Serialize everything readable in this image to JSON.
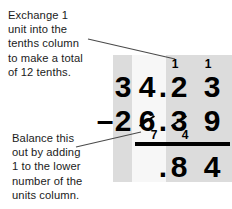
{
  "notes": {
    "top": "Exchange 1\nunit into the\ntenths column\nto make a total\nof 12 tenths.",
    "bottom": "Balance this\nout by adding\n1 to the lower\nnumber of the\nunits column."
  },
  "columns": [
    {
      "name": "tens",
      "shade": "#dcdcdc"
    },
    {
      "name": "units",
      "shade": "#f7f7f7"
    },
    {
      "name": "tenths",
      "shade": "#dcdcdc"
    },
    {
      "name": "hundredths",
      "shade": "#dcdcdc"
    }
  ],
  "calculation": {
    "operator": "–",
    "minuend": "34.23",
    "subtrahend": "26.39",
    "difference": ".84",
    "rows": {
      "top": {
        "tens": "3",
        "units": "4",
        "point": ".",
        "tenths": "2",
        "hundredths": "3",
        "carry_tenths": "1",
        "carry_hundredths": "1"
      },
      "bottom": {
        "operator": "–",
        "tens": "2",
        "units": "6",
        "units_struck": true,
        "units_correction": "7",
        "point": ".",
        "tenths": "3",
        "tenths_struck": true,
        "tenths_correction": "4",
        "hundredths": "9"
      },
      "answer": {
        "tens": "",
        "units": "",
        "point": ".",
        "tenths": "8",
        "hundredths": "4"
      }
    }
  },
  "colors": {
    "ink": "#000000",
    "text": "#1b1b1b",
    "leader": "#4a4a4a",
    "band_dark": "#dcdcdc",
    "band_light": "#f7f7f7",
    "background": "#ffffff"
  }
}
